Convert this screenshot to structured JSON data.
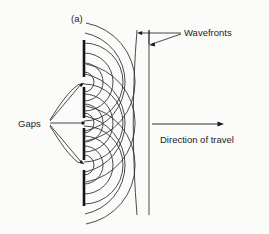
{
  "figure": {
    "panel_letter": "(a)",
    "labels": {
      "gaps": "Gaps",
      "wavefronts": "Wavefronts",
      "direction_of_travel": "Direction of travel"
    },
    "colors": {
      "ink": "#1b1b1b",
      "stroke": "#2b2b2b",
      "barrier": "#141414",
      "background": "#fbfbfa"
    },
    "geometry": {
      "barrier_x": 84,
      "barrier_top": 40,
      "barrier_bottom": 206,
      "gap_y": [
        82,
        123,
        165
      ],
      "gap_half_height": 5,
      "wavefront_x": [
        137,
        149
      ],
      "wavefront_top": 30,
      "wavefront_bottom": 215,
      "arc_radii": [
        10,
        19,
        29,
        39,
        50,
        60
      ],
      "direction_arrow": {
        "x1": 152,
        "x2": 224,
        "y": 124
      }
    }
  }
}
